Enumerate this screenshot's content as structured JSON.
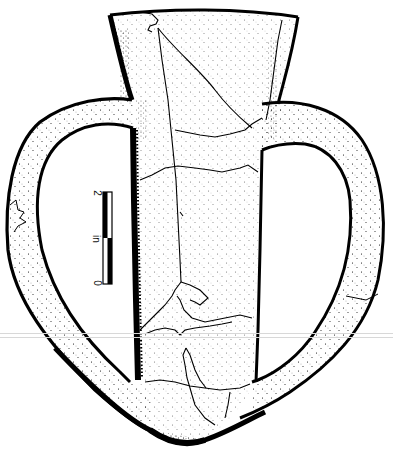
{
  "figure": {
    "ink_color": "#000000",
    "paper_color": "#ffffff"
  },
  "scale_bar": {
    "label_top": "2",
    "label_mid": "in",
    "label_bottom": "0",
    "units": "in",
    "segments": [
      "black",
      "white",
      "white",
      "black"
    ]
  },
  "scan_artifacts": {
    "horizontal_lines_y": [
      333,
      337
    ],
    "color": "#d8d8d8"
  }
}
